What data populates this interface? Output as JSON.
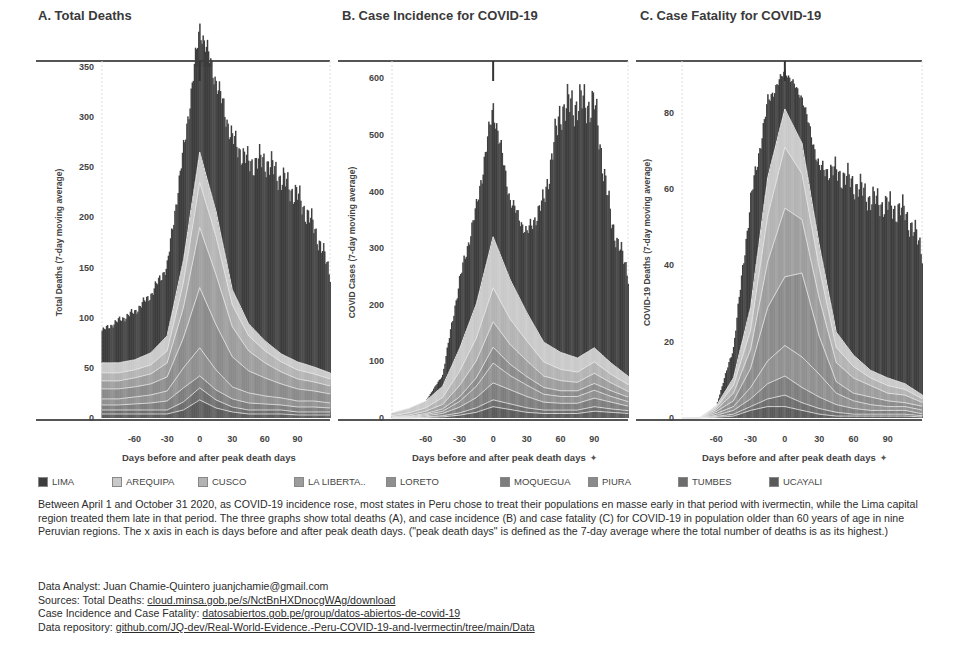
{
  "legend": [
    {
      "label": "LIMA",
      "color": "#3d3d3d"
    },
    {
      "label": "AREQUIPA",
      "color": "#c9c9c9"
    },
    {
      "label": "CUSCO",
      "color": "#b3b3b3"
    },
    {
      "label": "LA LIBERTA..",
      "color": "#9c9c9c"
    },
    {
      "label": "LORETO",
      "color": "#8f8f8f"
    },
    {
      "label": "MOQUEGUA",
      "color": "#7d7d7d"
    },
    {
      "label": "PIURA",
      "color": "#8a8a8a"
    },
    {
      "label": "TUMBES",
      "color": "#6c6c6c"
    },
    {
      "label": "UCAYALI",
      "color": "#5a5a5a"
    }
  ],
  "description": "Between April 1 and October 31 2020, as COVID-19 incidence rose, most states in Peru chose to treat their populations en masse early in that period with ivermectin, while the Lima capital region treated them late in that period. The three graphs show total deaths (A), and case incidence (B) and case fatality (C) for COVID-19 in population older than 60 years of age in nine Peruvian regions. The x axis in each is days before and after peak death days. (\"peak death days\" is defined as the 7-day average where the total number of deaths is as its highest.)",
  "credits": {
    "analyst_label": "Data Analyst: Juan Chamie-Quintero juanjchamie@gmail.com",
    "sources_label": "Sources: Total Deaths: ",
    "sources_link": "cloud.minsa.gob.pe/s/NctBnHXDnocgWAg/download",
    "incidence_label": "Case Incidence and Case Fatality: ",
    "incidence_link": "datosabiertos.gob.pe/group/datos-abiertos-de-covid-19",
    "repo_label": "Data repository: ",
    "repo_link": "github.com/JQ-dev/Real-World-Evidence.-Peru-COVID-19-and-Ivermectin/tree/main/Data"
  },
  "chart_data": [
    {
      "id": "A",
      "type": "bar",
      "stacked": true,
      "title": "A. Total Deaths",
      "xlabel": "Days before and after peak death days",
      "ylabel": "Total Deaths (7-day moving average)",
      "ylim": [
        0,
        350
      ],
      "yticks": [
        0,
        50,
        100,
        150,
        200,
        250,
        300,
        350
      ],
      "xlim": [
        -90,
        120
      ],
      "xticks": [
        -60,
        -30,
        0,
        30,
        60,
        90
      ],
      "peak_marker_x": 0,
      "x": [
        -90,
        -75,
        -60,
        -45,
        -30,
        -15,
        0,
        15,
        30,
        45,
        60,
        75,
        90,
        105,
        120
      ],
      "series": [
        {
          "name": "LIMA",
          "values": [
            32,
            42,
            48,
            58,
            70,
            110,
            125,
            130,
            150,
            160,
            180,
            175,
            165,
            140,
            100
          ]
        },
        {
          "name": "AREQUIPA",
          "values": [
            10,
            10,
            10,
            12,
            15,
            22,
            30,
            25,
            15,
            12,
            10,
            8,
            8,
            7,
            6
          ]
        },
        {
          "name": "CUSCO",
          "values": [
            8,
            8,
            8,
            9,
            12,
            25,
            45,
            38,
            22,
            15,
            12,
            10,
            9,
            8,
            7
          ]
        },
        {
          "name": "LA LIBERTA..",
          "values": [
            8,
            8,
            9,
            10,
            14,
            30,
            60,
            50,
            30,
            20,
            15,
            12,
            10,
            9,
            8
          ]
        },
        {
          "name": "LORETO",
          "values": [
            6,
            6,
            7,
            8,
            10,
            20,
            28,
            20,
            12,
            10,
            8,
            7,
            6,
            6,
            5
          ]
        },
        {
          "name": "MOQUEGUA",
          "values": [
            5,
            5,
            6,
            7,
            9,
            14,
            12,
            10,
            8,
            7,
            6,
            5,
            5,
            5,
            4
          ]
        },
        {
          "name": "PIURA",
          "values": [
            10,
            10,
            10,
            11,
            14,
            30,
            60,
            45,
            30,
            22,
            18,
            14,
            12,
            10,
            9
          ]
        },
        {
          "name": "TUMBES",
          "values": [
            4,
            4,
            4,
            4,
            4,
            8,
            12,
            8,
            5,
            4,
            4,
            4,
            3,
            3,
            3
          ]
        },
        {
          "name": "UCAYALI",
          "values": [
            4,
            4,
            4,
            4,
            4,
            8,
            18,
            10,
            6,
            4,
            4,
            4,
            3,
            3,
            3
          ]
        }
      ]
    },
    {
      "id": "B",
      "type": "bar",
      "stacked": true,
      "title": "B. Case Incidence for COVID-19",
      "xlabel": "Days before and after peak death days",
      "ylabel": "COVID Cases (7-day moving average)",
      "ylim": [
        0,
        620
      ],
      "yticks": [
        0,
        100,
        200,
        300,
        400,
        500,
        600
      ],
      "xlim": [
        -90,
        120
      ],
      "xticks": [
        -60,
        -30,
        0,
        30,
        60,
        90
      ],
      "peak_marker_x": 0,
      "x": [
        -90,
        -75,
        -60,
        -45,
        -30,
        -15,
        0,
        15,
        30,
        45,
        60,
        75,
        90,
        105,
        120
      ],
      "series": [
        {
          "name": "LIMA",
          "values": [
            0,
            0,
            0,
            20,
            120,
            170,
            230,
            140,
            140,
            250,
            430,
            450,
            430,
            250,
            180
          ]
        },
        {
          "name": "AREQUIPA",
          "values": [
            5,
            8,
            12,
            20,
            40,
            60,
            90,
            70,
            50,
            35,
            30,
            25,
            25,
            20,
            15
          ]
        },
        {
          "name": "CUSCO",
          "values": [
            2,
            4,
            6,
            12,
            25,
            40,
            60,
            45,
            35,
            25,
            20,
            18,
            20,
            15,
            12
          ]
        },
        {
          "name": "LA LIBERTA..",
          "values": [
            1,
            2,
            4,
            8,
            20,
            30,
            45,
            35,
            28,
            20,
            18,
            15,
            18,
            14,
            10
          ]
        },
        {
          "name": "LORETO",
          "values": [
            1,
            1,
            2,
            4,
            10,
            20,
            35,
            25,
            20,
            14,
            12,
            12,
            14,
            10,
            8
          ]
        },
        {
          "name": "MOQUEGUA",
          "values": [
            0,
            1,
            2,
            4,
            10,
            18,
            30,
            25,
            20,
            14,
            12,
            12,
            15,
            12,
            8
          ]
        },
        {
          "name": "PIURA",
          "values": [
            0,
            1,
            2,
            4,
            8,
            15,
            28,
            20,
            15,
            12,
            10,
            10,
            12,
            10,
            8
          ]
        },
        {
          "name": "TUMBES",
          "values": [
            0,
            0,
            1,
            2,
            4,
            8,
            12,
            10,
            8,
            6,
            6,
            6,
            8,
            6,
            5
          ]
        },
        {
          "name": "UCAYALI",
          "values": [
            0,
            0,
            1,
            2,
            5,
            10,
            20,
            15,
            10,
            8,
            8,
            8,
            12,
            10,
            8
          ]
        }
      ]
    },
    {
      "id": "C",
      "type": "bar",
      "stacked": true,
      "title": "C. Case Fatality for COVID-19",
      "xlabel": "Days before and after peak death days",
      "ylabel": "COVID-19 Deaths (7-day moving average)",
      "ylim": [
        0,
        92
      ],
      "yticks": [
        0,
        20,
        40,
        60,
        80
      ],
      "xlim": [
        -90,
        120
      ],
      "xticks": [
        -60,
        -30,
        0,
        30,
        60,
        90
      ],
      "peak_marker_x": 0,
      "x": [
        -90,
        -75,
        -60,
        -45,
        -30,
        -15,
        0,
        15,
        30,
        45,
        60,
        75,
        90,
        105,
        120
      ],
      "series": [
        {
          "name": "LIMA",
          "values": [
            0,
            0,
            0,
            8,
            28,
            20,
            10,
            12,
            20,
            42,
            45,
            45,
            45,
            45,
            38
          ]
        },
        {
          "name": "AREQUIPA",
          "values": [
            0,
            0,
            0.5,
            2,
            6,
            10,
            10,
            8,
            6,
            4,
            3,
            2,
            2,
            1.5,
            1
          ]
        },
        {
          "name": "CUSCO",
          "values": [
            0,
            0,
            0.5,
            2,
            5,
            12,
            16,
            12,
            8,
            4,
            3,
            2,
            2,
            1.5,
            1
          ]
        },
        {
          "name": "LA LIBERTA..",
          "values": [
            0,
            0,
            0.5,
            2,
            5,
            12,
            18,
            14,
            10,
            5,
            4,
            3,
            2,
            2,
            1
          ]
        },
        {
          "name": "LORETO",
          "values": [
            0,
            0,
            0.5,
            1,
            3,
            6,
            8,
            8,
            6,
            3,
            2,
            1.5,
            1,
            1,
            1
          ]
        },
        {
          "name": "MOQUEGUA",
          "values": [
            0,
            0,
            0.3,
            1,
            2,
            4,
            5,
            4,
            3,
            2,
            1.5,
            1,
            1,
            1,
            0.5
          ]
        },
        {
          "name": "PIURA",
          "values": [
            0,
            0,
            0.5,
            1.5,
            5,
            14,
            18,
            22,
            10,
            3,
            2,
            2,
            1.5,
            1,
            1
          ]
        },
        {
          "name": "TUMBES",
          "values": [
            0,
            0,
            0.2,
            0.5,
            1,
            2,
            3,
            2,
            1.5,
            1,
            0.5,
            0.5,
            0.5,
            0.5,
            0.3
          ]
        },
        {
          "name": "UCAYALI",
          "values": [
            0,
            0,
            0.2,
            0.5,
            2,
            3,
            3,
            2,
            1,
            0.5,
            0.5,
            0.5,
            0.5,
            0.5,
            0.3
          ]
        }
      ]
    }
  ],
  "layout": {
    "panels": [
      {
        "title_x": 38,
        "plot_x0": 102,
        "plot_x1": 330,
        "axis_x0": 36,
        "axis_x1": 330,
        "plot_y0": 61,
        "plot_y1": 418,
        "ylabel_x": 62,
        "xlabel_x": 120
      },
      {
        "title_x": 342,
        "plot_x0": 392,
        "plot_x1": 628,
        "axis_x0": 338,
        "axis_x1": 628,
        "plot_y0": 61,
        "plot_y1": 418,
        "ylabel_x": 355,
        "xlabel_x": 404
      },
      {
        "title_x": 640,
        "plot_x0": 682,
        "plot_x1": 922,
        "axis_x0": 636,
        "axis_x1": 922,
        "plot_y0": 61,
        "plot_y1": 418,
        "ylabel_x": 650,
        "xlabel_x": 700
      }
    ]
  }
}
